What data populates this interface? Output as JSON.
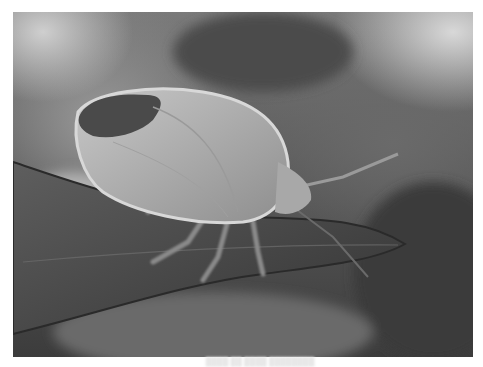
{
  "image": {
    "subject": "shield bug (stink bug) on a leaf",
    "style": "grayscale macro photograph",
    "colors": {
      "background_light": "#cfcfcf",
      "background_dark": "#3c3c3c",
      "bug_body": "#b5b5b5",
      "bug_wing_dark": "#4a4a4a",
      "leaf": "#4e4e4e",
      "leaf_edge": "#2a2a2a"
    }
  },
  "caption": {
    "text": "████ ██ ████ ████████"
  }
}
